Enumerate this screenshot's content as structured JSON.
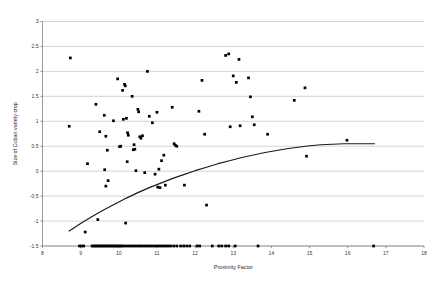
{
  "chart_data": {
    "type": "scatter",
    "title": "",
    "xlabel": "Proximity Factor",
    "ylabel": "Size of Cuban variety crop",
    "xlim": [
      8,
      18
    ],
    "ylim": [
      -1.5,
      3
    ],
    "xticks": [
      8,
      9,
      10,
      11,
      12,
      13,
      14,
      15,
      16,
      17,
      18
    ],
    "xtick_labels": [
      "8",
      "9",
      "10",
      "11",
      "12",
      "13",
      "14",
      "15",
      "16",
      "17",
      "18"
    ],
    "yticks": [
      -1.5,
      -1,
      -0.5,
      0,
      0.5,
      1,
      1.5,
      2,
      2.5,
      3
    ],
    "ytick_labels": [
      "-1.5",
      "-1",
      "-0.5",
      "0",
      "0.5",
      "1",
      "1.5",
      "2",
      "2.5",
      "3"
    ],
    "grid": "horizontal",
    "legend": "none",
    "marker": "filled-square",
    "marker_color": "#000000",
    "gridline_color": "#b8b8b8",
    "axis_color": "#808080",
    "curve_color": "#1a1a1a",
    "series": [
      {
        "name": "observations",
        "points": [
          [
            8.73,
            2.27
          ],
          [
            8.7,
            0.9
          ],
          [
            9.12,
            -1.22
          ],
          [
            9.18,
            0.15
          ],
          [
            9.4,
            1.34
          ],
          [
            9.45,
            -0.97
          ],
          [
            9.5,
            0.79
          ],
          [
            9.62,
            1.12
          ],
          [
            9.63,
            0.03
          ],
          [
            9.66,
            0.7
          ],
          [
            9.7,
            0.42
          ],
          [
            9.66,
            -0.3
          ],
          [
            9.72,
            -0.19
          ],
          [
            9.86,
            1.01
          ],
          [
            9.97,
            1.85
          ],
          [
            10.02,
            0.49
          ],
          [
            10.05,
            0.5
          ],
          [
            10.1,
            1.62
          ],
          [
            10.15,
            1.74
          ],
          [
            10.17,
            1.71
          ],
          [
            10.12,
            1.04
          ],
          [
            10.2,
            1.06
          ],
          [
            10.23,
            0.77
          ],
          [
            10.25,
            0.72
          ],
          [
            10.22,
            0.19
          ],
          [
            10.18,
            -1.04
          ],
          [
            10.35,
            1.5
          ],
          [
            10.38,
            0.43
          ],
          [
            10.4,
            0.53
          ],
          [
            10.42,
            0.44
          ],
          [
            10.45,
            0.01
          ],
          [
            10.5,
            1.24
          ],
          [
            10.52,
            1.19
          ],
          [
            10.55,
            0.69
          ],
          [
            10.58,
            0.66
          ],
          [
            10.62,
            0.71
          ],
          [
            10.68,
            -0.03
          ],
          [
            10.75,
            2.0
          ],
          [
            10.8,
            1.1
          ],
          [
            10.88,
            0.97
          ],
          [
            10.95,
            -0.06
          ],
          [
            11.0,
            1.18
          ],
          [
            11.05,
            0.04
          ],
          [
            11.02,
            -0.32
          ],
          [
            11.08,
            -0.33
          ],
          [
            11.12,
            0.21
          ],
          [
            11.18,
            0.32
          ],
          [
            11.22,
            -0.28
          ],
          [
            11.4,
            1.28
          ],
          [
            11.45,
            0.55
          ],
          [
            11.48,
            0.52
          ],
          [
            11.52,
            0.5
          ],
          [
            11.72,
            -0.28
          ],
          [
            12.1,
            1.2
          ],
          [
            12.18,
            1.82
          ],
          [
            12.25,
            0.74
          ],
          [
            12.3,
            -0.68
          ],
          [
            12.8,
            2.32
          ],
          [
            12.88,
            2.35
          ],
          [
            12.92,
            0.89
          ],
          [
            13.0,
            1.91
          ],
          [
            13.08,
            1.78
          ],
          [
            13.15,
            2.24
          ],
          [
            13.18,
            0.91
          ],
          [
            13.4,
            1.87
          ],
          [
            13.45,
            1.49
          ],
          [
            13.5,
            1.09
          ],
          [
            13.55,
            0.93
          ],
          [
            13.9,
            0.74
          ],
          [
            14.6,
            1.42
          ],
          [
            14.88,
            1.67
          ],
          [
            14.92,
            0.3
          ],
          [
            15.98,
            0.62
          ],
          [
            8.97,
            -1.5
          ],
          [
            9.02,
            -1.5
          ],
          [
            9.08,
            -1.5
          ],
          [
            9.3,
            -1.5
          ],
          [
            9.34,
            -1.5
          ],
          [
            9.38,
            -1.5
          ],
          [
            9.42,
            -1.5
          ],
          [
            9.46,
            -1.5
          ],
          [
            9.5,
            -1.5
          ],
          [
            9.54,
            -1.5
          ],
          [
            9.58,
            -1.5
          ],
          [
            9.62,
            -1.5
          ],
          [
            9.66,
            -1.5
          ],
          [
            9.7,
            -1.5
          ],
          [
            9.74,
            -1.5
          ],
          [
            9.78,
            -1.5
          ],
          [
            9.82,
            -1.5
          ],
          [
            9.86,
            -1.5
          ],
          [
            9.9,
            -1.5
          ],
          [
            9.94,
            -1.5
          ],
          [
            9.98,
            -1.5
          ],
          [
            10.02,
            -1.5
          ],
          [
            10.06,
            -1.5
          ],
          [
            10.1,
            -1.5
          ],
          [
            10.16,
            -1.5
          ],
          [
            10.22,
            -1.5
          ],
          [
            10.28,
            -1.5
          ],
          [
            10.34,
            -1.5
          ],
          [
            10.4,
            -1.5
          ],
          [
            10.46,
            -1.5
          ],
          [
            10.52,
            -1.5
          ],
          [
            10.58,
            -1.5
          ],
          [
            10.64,
            -1.5
          ],
          [
            10.7,
            -1.5
          ],
          [
            10.76,
            -1.5
          ],
          [
            10.82,
            -1.5
          ],
          [
            10.88,
            -1.5
          ],
          [
            10.94,
            -1.5
          ],
          [
            11.0,
            -1.5
          ],
          [
            11.06,
            -1.5
          ],
          [
            11.12,
            -1.5
          ],
          [
            11.18,
            -1.5
          ],
          [
            11.24,
            -1.5
          ],
          [
            11.3,
            -1.5
          ],
          [
            11.36,
            -1.5
          ],
          [
            11.44,
            -1.5
          ],
          [
            11.52,
            -1.5
          ],
          [
            11.62,
            -1.5
          ],
          [
            11.7,
            -1.5
          ],
          [
            11.78,
            -1.5
          ],
          [
            11.86,
            -1.5
          ],
          [
            12.05,
            -1.5
          ],
          [
            12.12,
            -1.5
          ],
          [
            12.45,
            -1.5
          ],
          [
            12.62,
            -1.5
          ],
          [
            12.7,
            -1.5
          ],
          [
            12.8,
            -1.5
          ],
          [
            12.88,
            -1.5
          ],
          [
            13.05,
            -1.5
          ],
          [
            13.65,
            -1.5
          ],
          [
            16.68,
            -1.5
          ]
        ]
      }
    ],
    "fit_curve": {
      "name": "fitted-trend",
      "points": [
        [
          8.7,
          -1.2
        ],
        [
          9.0,
          -1.05
        ],
        [
          9.3,
          -0.91
        ],
        [
          9.6,
          -0.78
        ],
        [
          9.9,
          -0.66
        ],
        [
          10.2,
          -0.54
        ],
        [
          10.5,
          -0.43
        ],
        [
          10.8,
          -0.33
        ],
        [
          11.1,
          -0.24
        ],
        [
          11.4,
          -0.15
        ],
        [
          11.7,
          -0.07
        ],
        [
          12.0,
          0.01
        ],
        [
          12.3,
          0.08
        ],
        [
          12.6,
          0.15
        ],
        [
          12.9,
          0.21
        ],
        [
          13.2,
          0.27
        ],
        [
          13.5,
          0.32
        ],
        [
          13.8,
          0.37
        ],
        [
          14.1,
          0.41
        ],
        [
          14.4,
          0.45
        ],
        [
          14.7,
          0.48
        ],
        [
          15.0,
          0.51
        ],
        [
          15.3,
          0.53
        ],
        [
          15.6,
          0.54
        ],
        [
          15.9,
          0.55
        ],
        [
          16.2,
          0.55
        ],
        [
          16.5,
          0.55
        ],
        [
          16.7,
          0.55
        ]
      ]
    }
  }
}
